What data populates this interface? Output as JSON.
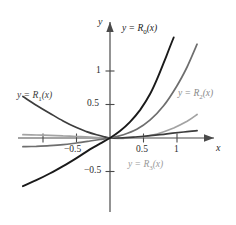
{
  "chart_data": {
    "type": "line",
    "title": "",
    "subtitle": "",
    "xlabel": "x",
    "ylabel": "y",
    "xlim": [
      -1.35,
      1.35
    ],
    "ylim": [
      -0.95,
      1.45
    ],
    "grid": false,
    "legend_position": "inline-curve-labels",
    "x_ticks": [
      {
        "value": -1,
        "label": ""
      },
      {
        "value": -0.5,
        "label": "−0.5"
      },
      {
        "value": 0.5,
        "label": "0.5"
      },
      {
        "value": 1,
        "label": "1"
      }
    ],
    "y_ticks": [
      {
        "value": 1,
        "label": "1"
      },
      {
        "value": 0.5,
        "label": "0.5"
      },
      {
        "value": -0.5,
        "label": "−0.5"
      }
    ],
    "axes": {
      "x_axis_name": "x",
      "y_axis_name": "y",
      "x_arrow": "right",
      "y_arrow": "up"
    },
    "series": [
      {
        "name": "R0",
        "label": "y = R",
        "label_sub": "0",
        "label_tail": "(x)",
        "color": "#1a1a1a",
        "width": 1.9,
        "x": [
          -1.3,
          -1.1,
          -0.9,
          -0.7,
          -0.5,
          -0.3,
          -0.15,
          0,
          0.15,
          0.3,
          0.45,
          0.6,
          0.72,
          0.84,
          0.95
        ],
        "y": [
          -0.72,
          -0.63,
          -0.53,
          -0.42,
          -0.3,
          -0.17,
          -0.085,
          0,
          0.105,
          0.24,
          0.42,
          0.66,
          0.92,
          1.22,
          1.5
        ]
      },
      {
        "name": "R1",
        "label": "y = R",
        "label_sub": "1",
        "label_tail": "(x)",
        "color": "#3d3d3d",
        "width": 1.7,
        "x": [
          -1.3,
          -1.1,
          -0.9,
          -0.7,
          -0.5,
          -0.35,
          -0.2,
          -0.1,
          0,
          0.15,
          0.35,
          0.6,
          0.85,
          1.1,
          1.3
        ],
        "y": [
          0.62,
          0.49,
          0.37,
          0.255,
          0.155,
          0.095,
          0.048,
          0.022,
          0,
          0.0,
          0.012,
          0.035,
          0.062,
          0.09,
          0.11
        ]
      },
      {
        "name": "R2",
        "label": "y = R",
        "label_sub": "2",
        "label_tail": "(x)",
        "color": "#6e6e6e",
        "width": 1.7,
        "x": [
          -1.3,
          -1.1,
          -0.9,
          -0.7,
          -0.5,
          -0.3,
          -0.15,
          0,
          0.2,
          0.4,
          0.6,
          0.8,
          1.0,
          1.15,
          1.3
        ],
        "y": [
          -0.13,
          -0.125,
          -0.115,
          -0.1,
          -0.075,
          -0.045,
          -0.022,
          0,
          0.05,
          0.13,
          0.27,
          0.48,
          0.78,
          1.06,
          1.4
        ]
      },
      {
        "name": "R3",
        "label": "y = R",
        "label_sub": "3",
        "label_tail": "(x)",
        "color": "#a3a3a3",
        "width": 1.7,
        "x": [
          -1.3,
          -1.1,
          -0.9,
          -0.7,
          -0.5,
          -0.3,
          -0.15,
          0,
          0.2,
          0.45,
          0.7,
          0.95,
          1.15,
          1.3
        ],
        "y": [
          0.05,
          0.045,
          0.04,
          0.032,
          0.023,
          0.013,
          0.006,
          0,
          -0.004,
          0.012,
          0.06,
          0.15,
          0.25,
          0.35
        ]
      }
    ],
    "annotations": [
      {
        "name": "label-r0",
        "text": "y = R0(x)",
        "x": 0.35,
        "y": 1.22
      },
      {
        "name": "label-r1",
        "text": "y = R1(x)",
        "x": -1.2,
        "y": 0.58
      },
      {
        "name": "label-r2",
        "text": "y = R2(x)",
        "x": 1.0,
        "y": 0.52
      },
      {
        "name": "label-r3",
        "text": "y = R3(x)",
        "x": 0.45,
        "y": -0.26
      }
    ]
  },
  "labels": {
    "y_axis": "y",
    "x_axis": "x",
    "tick_y_1": "1",
    "tick_y_05": "0.5",
    "tick_y_neg05": "−0.5",
    "tick_x_05": "0.5",
    "tick_x_1": "1",
    "tick_x_neg05": "−0.5",
    "eq_prefix": "y = R",
    "eq_suffix": "(x)",
    "sub_0": "0",
    "sub_1": "1",
    "sub_2": "2",
    "sub_3": "3"
  },
  "colors": {
    "r0": "#1a1a1a",
    "r1": "#3d3d3d",
    "r2": "#6e6e6e",
    "r3": "#a3a3a3",
    "axis": "#4a4a4a",
    "text": "#2b2b2b",
    "background": "#ffffff"
  }
}
